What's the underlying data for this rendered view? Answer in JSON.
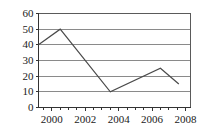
{
  "chart_data": {
    "type": "line",
    "title": "",
    "subtitle": "",
    "xlabel": "",
    "ylabel": "",
    "xlim": [
      1999.2,
      2008.3
    ],
    "ylim": [
      0,
      60
    ],
    "grid": true,
    "legend": false,
    "legend_position": "none",
    "x_ticks": [
      2000,
      2002,
      2004,
      2006,
      2008
    ],
    "x_tick_labels": [
      "2000",
      "2002",
      "2004",
      "2006",
      "2008"
    ],
    "x_minor_ticks": [
      1999.5,
      2000.5,
      2001,
      2001.5,
      2002.5,
      2003,
      2003.5,
      2004.5,
      2005,
      2005.5,
      2006.5,
      2007,
      2007.5
    ],
    "y_ticks": [
      0,
      10,
      20,
      30,
      40,
      50,
      60
    ],
    "y_tick_labels": [
      "0",
      "10",
      "20",
      "30",
      "40",
      "50",
      "60"
    ],
    "series": [
      {
        "name": "series-1",
        "color": "#4a4a4a",
        "x": [
          1999.2,
          2000.5,
          2003.5,
          2006.5,
          2007.6
        ],
        "values": [
          40,
          50,
          10,
          25,
          15
        ]
      }
    ]
  },
  "style": {
    "line_color": "#4a4a4a",
    "grid_color": "#8a8a8a",
    "axis_color": "#333333",
    "frame_color": "#5a5a5a",
    "text_color": "#1a1a1a",
    "background": "#ffffff"
  }
}
